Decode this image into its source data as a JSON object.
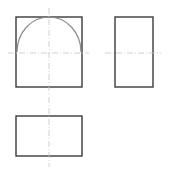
{
  "drawing": {
    "type": "orthographic-projection",
    "views": [
      {
        "name": "front-view",
        "shape": "square-with-semicircle",
        "x": 16,
        "y": 17,
        "width": 66,
        "height": 70
      },
      {
        "name": "side-view",
        "shape": "rectangle",
        "x": 115,
        "y": 17,
        "width": 38,
        "height": 70
      },
      {
        "name": "top-view",
        "shape": "rectangle",
        "x": 16,
        "y": 116,
        "width": 66,
        "height": 40
      }
    ],
    "colors": {
      "outline": "#3a3a3a",
      "arc": "#8a8a8a",
      "centerline": "#c4c4c4",
      "background": "#ffffff"
    }
  }
}
